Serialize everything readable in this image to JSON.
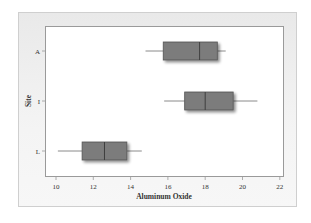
{
  "chart_data": {
    "type": "boxplot",
    "orientation": "horizontal",
    "title": "",
    "xlabel": "Aluminum Oxide",
    "ylabel": "Site",
    "xlim": [
      9.5,
      22.2
    ],
    "xticks": [
      10,
      12,
      14,
      16,
      18,
      20,
      22
    ],
    "grid": false,
    "legend": null,
    "categories": [
      "A",
      "I",
      "L"
    ],
    "series": [
      {
        "name": "A",
        "whisker_low": 14.8,
        "q1": 15.75,
        "median": 17.7,
        "q3": 18.65,
        "whisker_high": 19.1
      },
      {
        "name": "I",
        "whisker_low": 15.8,
        "q1": 16.9,
        "median": 18.0,
        "q3": 19.5,
        "whisker_high": 20.8
      },
      {
        "name": "L",
        "whisker_low": 10.1,
        "q1": 11.4,
        "median": 12.6,
        "q3": 13.8,
        "whisker_high": 14.6
      }
    ],
    "colors": {
      "box_fill": "#7b7b7b",
      "box_stroke": "#555555",
      "whisker": "#8a8a8a",
      "axis": "#9a9a9a",
      "text": "#333333"
    }
  }
}
